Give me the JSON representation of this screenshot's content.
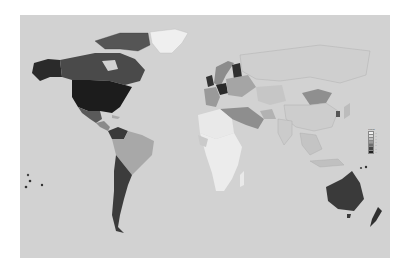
{
  "map": {
    "type": "choropleth world map",
    "background_color": "#d2d2d2",
    "ocean_color": "#d2d2d2",
    "palette": [
      "#f2f2f2",
      "#dcdcdc",
      "#bdbdbd",
      "#9a9a9a",
      "#6e6e6e",
      "#454545",
      "#222222"
    ],
    "regions": [
      {
        "name": "Alaska",
        "shade": "#2a2a2a"
      },
      {
        "name": "Canada",
        "shade": "#4a4a4a"
      },
      {
        "name": "United States",
        "shade": "#1c1c1c"
      },
      {
        "name": "Greenland",
        "shade": "#efefef"
      },
      {
        "name": "Mexico",
        "shade": "#5a5a5a"
      },
      {
        "name": "Central America",
        "shade": "#8a8a8a"
      },
      {
        "name": "Venezuela/Colombia",
        "shade": "#3a3a3a"
      },
      {
        "name": "Brazil",
        "shade": "#a8a8a8"
      },
      {
        "name": "Argentina/Chile",
        "shade": "#3c3c3c"
      },
      {
        "name": "Scandinavia",
        "shade": "#8c8c8c"
      },
      {
        "name": "Finland",
        "shade": "#2e2e2e"
      },
      {
        "name": "United Kingdom",
        "shade": "#333333"
      },
      {
        "name": "Germany",
        "shade": "#2a2a2a"
      },
      {
        "name": "Eastern Europe",
        "shade": "#a5a5a5"
      },
      {
        "name": "Middle East",
        "shade": "#8e8e8e"
      },
      {
        "name": "North Africa",
        "shade": "#e9e9e9"
      },
      {
        "name": "Sub-Saharan Africa",
        "shade": "#ececec"
      },
      {
        "name": "Mongolia",
        "shade": "#8f8f8f"
      },
      {
        "name": "Australia",
        "shade": "#3a3a3a"
      },
      {
        "name": "New Zealand",
        "shade": "#2f2f2f"
      }
    ]
  },
  "legend": {
    "title": "Legend",
    "items": [
      {
        "label": "—",
        "color": "#f2f2f2"
      },
      {
        "label": "—",
        "color": "#dcdcdc"
      },
      {
        "label": "—",
        "color": "#bdbdbd"
      },
      {
        "label": "—",
        "color": "#9a9a9a"
      },
      {
        "label": "—",
        "color": "#6e6e6e"
      },
      {
        "label": "—",
        "color": "#454545"
      },
      {
        "label": "—",
        "color": "#222222"
      }
    ]
  }
}
